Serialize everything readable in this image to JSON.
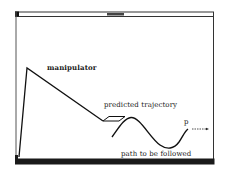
{
  "window": {
    "title": "",
    "colors": {
      "frame": "#222222",
      "background": "#ffffff",
      "ink": "#1a1a1a"
    }
  },
  "diagram": {
    "labels": {
      "manipulator": "manipulator",
      "predicted_trajectory": "predicted trajectory",
      "path": "path to be followed",
      "point": "p"
    },
    "elements": [
      {
        "name": "manipulator-arm",
        "type": "polyline",
        "points": [
          [
            19,
            157
          ],
          [
            27,
            68
          ],
          [
            103,
            121
          ]
        ]
      },
      {
        "name": "predicted-trajectory",
        "type": "parallelogram",
        "points": [
          [
            103,
            121
          ],
          [
            109,
            116
          ],
          [
            125,
            116
          ],
          [
            119,
            121
          ]
        ]
      },
      {
        "name": "path-to-be-followed",
        "type": "curve"
      },
      {
        "name": "direction-arrow",
        "type": "dashed-arrow",
        "from": [
          192,
          129
        ],
        "to": [
          208,
          129
        ]
      }
    ]
  }
}
